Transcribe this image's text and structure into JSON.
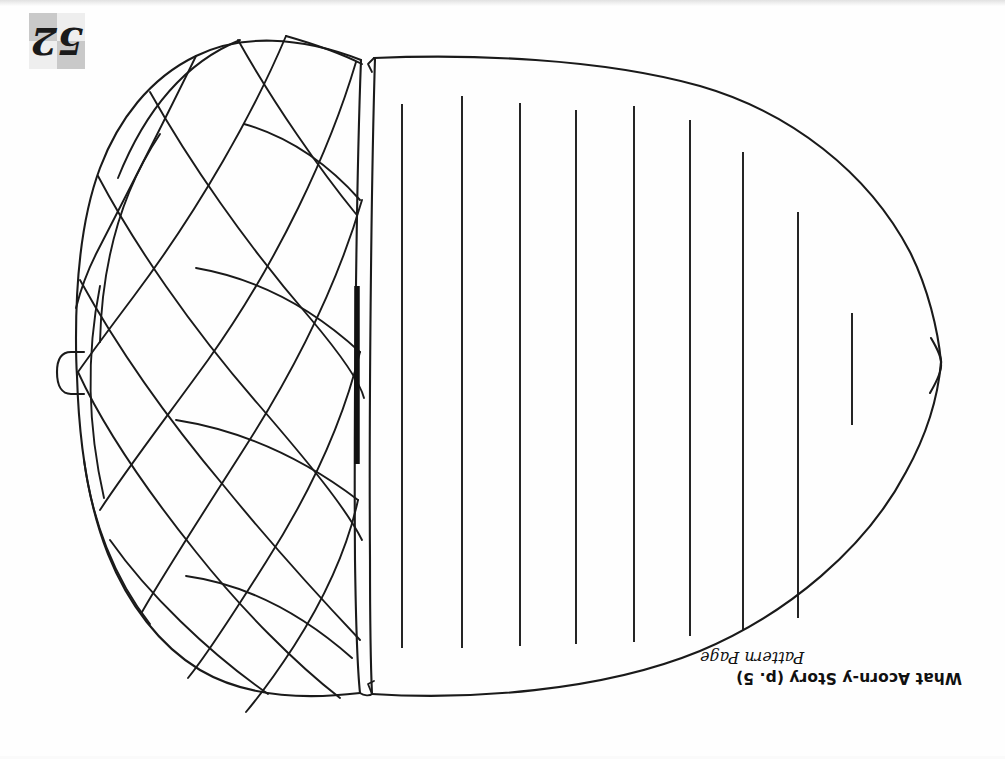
{
  "document": {
    "kind": "scanned-craft-pattern-page",
    "orientation_note": "page content printed upside-down relative to scan",
    "page_number": "52",
    "background_color": "#fefefe",
    "ink_color": "#1a1a1a"
  },
  "page_number_badge": {
    "value": "52",
    "checker_dark": "#c9c9c9",
    "checker_light": "#eeeeee"
  },
  "footer": {
    "title": "What Acorn-y Story (p. 5)",
    "subtitle": "Pattern Page"
  },
  "artwork": {
    "title": "acorn-pattern-template",
    "stroke_color": "#1a1a1a",
    "fill_color": "#ffffff",
    "parts": [
      {
        "name": "acorn-cap",
        "description": "crosshatched scale-patterned cap on the left"
      },
      {
        "name": "acorn-stem",
        "description": "small rounded nub protruding at far left"
      },
      {
        "name": "acorn-nut-body",
        "description": "large pointed oval body on the right"
      },
      {
        "name": "cap-rim-band",
        "description": "narrow vertical band dividing cap from nut"
      },
      {
        "name": "rim-accent-mark",
        "description": "thick black vertical tick on the rim band"
      },
      {
        "name": "nut-texture-lines",
        "description": "nine vertical grain lines inside the nut body"
      }
    ],
    "nut_texture_lines": [
      {
        "x": 402,
        "y1": 104,
        "y2": 648
      },
      {
        "x": 462,
        "y1": 96,
        "y2": 648
      },
      {
        "x": 520,
        "y1": 103,
        "y2": 646
      },
      {
        "x": 576,
        "y1": 110,
        "y2": 644
      },
      {
        "x": 634,
        "y1": 106,
        "y2": 642
      },
      {
        "x": 690,
        "y1": 120,
        "y2": 636
      },
      {
        "x": 743,
        "y1": 152,
        "y2": 630
      },
      {
        "x": 798,
        "y1": 212,
        "y2": 618
      },
      {
        "x": 852,
        "y1": 313,
        "y2": 425
      }
    ]
  }
}
